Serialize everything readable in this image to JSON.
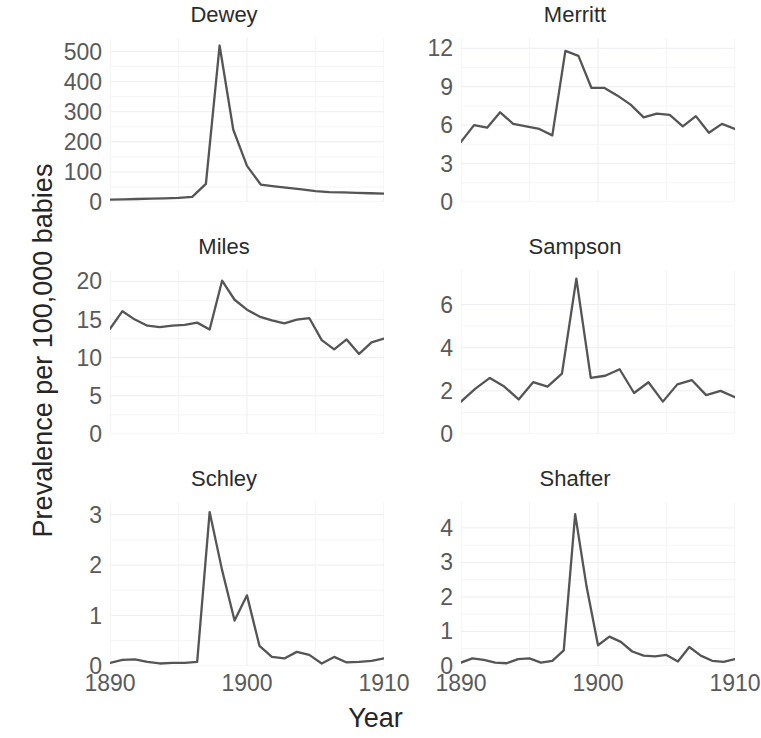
{
  "chart_data": {
    "type": "line",
    "title": "",
    "xlabel": "Year",
    "ylabel": "Prevalence per 100,000 babies",
    "grid": true,
    "legend": null,
    "layout": "2 columns x 3 rows small-multiples (faceted line charts)",
    "x": [
      1890,
      1891,
      1892,
      1893,
      1894,
      1895,
      1896,
      1897,
      1898,
      1899,
      1900,
      1901,
      1902,
      1903,
      1904,
      1905,
      1906,
      1907,
      1908,
      1909,
      1910
    ],
    "xlim": [
      1890,
      1910
    ],
    "xticks": [
      1890,
      1900,
      1910
    ],
    "xticklabels": [
      "1890",
      "1900",
      "1910"
    ],
    "panels": [
      {
        "name": "Dewey",
        "row": 0,
        "col": 0,
        "ylim": [
          0,
          545
        ],
        "yticks": [
          0,
          100,
          200,
          300,
          400,
          500
        ],
        "yticklabels": [
          "0",
          "100",
          "200",
          "300",
          "400",
          "500"
        ],
        "values": [
          8,
          9,
          10,
          11,
          12,
          14,
          17,
          60,
          520,
          240,
          120,
          58,
          52,
          47,
          42,
          36,
          33,
          32,
          30,
          29,
          28
        ]
      },
      {
        "name": "Merritt",
        "row": 0,
        "col": 1,
        "ylim": [
          0,
          12.8
        ],
        "yticks": [
          0,
          3,
          6,
          9,
          12
        ],
        "yticklabels": [
          "0",
          "3",
          "6",
          "9",
          "12"
        ],
        "values": [
          4.7,
          6.0,
          5.8,
          7.0,
          6.1,
          5.9,
          5.7,
          5.2,
          11.8,
          11.4,
          8.9,
          8.9,
          8.3,
          7.6,
          6.6,
          6.9,
          6.8,
          5.9,
          6.7,
          5.4,
          6.1,
          5.7
        ]
      },
      {
        "name": "Miles",
        "row": 1,
        "col": 0,
        "ylim": [
          0,
          21.5
        ],
        "yticks": [
          0,
          5,
          10,
          15,
          20
        ],
        "yticklabels": [
          "0",
          "5",
          "10",
          "15",
          "20"
        ],
        "values": [
          13.8,
          16.1,
          15.0,
          14.2,
          14.0,
          14.2,
          14.3,
          14.6,
          13.7,
          20.1,
          17.6,
          16.3,
          15.4,
          14.9,
          14.5,
          15.0,
          15.2,
          12.3,
          11.1,
          12.4,
          10.5,
          12.0,
          12.5
        ]
      },
      {
        "name": "Sampson",
        "row": 1,
        "col": 1,
        "ylim": [
          0,
          7.6
        ],
        "yticks": [
          0,
          2,
          4,
          6
        ],
        "yticklabels": [
          "0",
          "2",
          "4",
          "6"
        ],
        "values": [
          1.5,
          2.1,
          2.6,
          2.2,
          1.6,
          2.4,
          2.2,
          2.8,
          7.2,
          2.6,
          2.7,
          3.0,
          1.9,
          2.4,
          1.5,
          2.3,
          2.5,
          1.8,
          2.0,
          1.7
        ]
      },
      {
        "name": "Schley",
        "row": 2,
        "col": 0,
        "ylim": [
          0,
          3.25
        ],
        "yticks": [
          0,
          1,
          2,
          3
        ],
        "yticklabels": [
          "0",
          "1",
          "2",
          "3"
        ],
        "values": [
          0.06,
          0.12,
          0.13,
          0.08,
          0.05,
          0.06,
          0.06,
          0.08,
          3.05,
          1.9,
          0.9,
          1.4,
          0.4,
          0.18,
          0.15,
          0.28,
          0.22,
          0.05,
          0.18,
          0.07,
          0.08,
          0.1,
          0.15
        ]
      },
      {
        "name": "Shafter",
        "row": 2,
        "col": 1,
        "ylim": [
          0,
          4.75
        ],
        "yticks": [
          0,
          1,
          2,
          3,
          4
        ],
        "yticklabels": [
          "0",
          "1",
          "2",
          "3",
          "4"
        ],
        "values": [
          0.1,
          0.22,
          0.18,
          0.1,
          0.08,
          0.2,
          0.22,
          0.1,
          0.15,
          0.45,
          4.4,
          2.3,
          0.6,
          0.85,
          0.7,
          0.42,
          0.3,
          0.28,
          0.32,
          0.13,
          0.55,
          0.3,
          0.15,
          0.12,
          0.2
        ]
      }
    ]
  },
  "axis": {
    "y_title": "Prevalence per 100,000 babies",
    "x_title": "Year"
  },
  "style": {
    "line_color": "#555555",
    "grid_color": "#ededf2",
    "tick_color": "#5a5a5a",
    "title_color": "#2b2b2b",
    "background": "#ffffff"
  }
}
